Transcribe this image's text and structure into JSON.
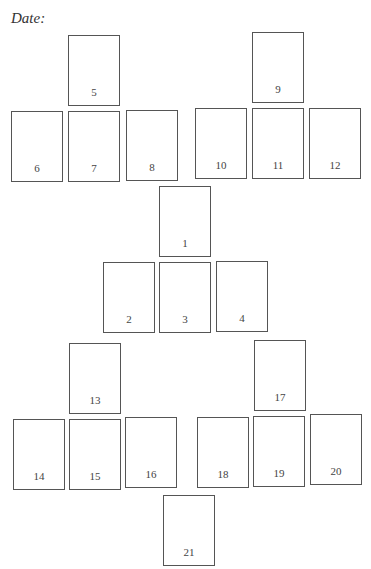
{
  "header": {
    "date_label": "Date:"
  },
  "spread": {
    "border_color": "#555555",
    "slots": [
      {
        "number": "1",
        "x": 159,
        "y": 186
      },
      {
        "number": "2",
        "x": 103,
        "y": 262
      },
      {
        "number": "3",
        "x": 159,
        "y": 262
      },
      {
        "number": "4",
        "x": 216,
        "y": 261
      },
      {
        "number": "5",
        "x": 68,
        "y": 35
      },
      {
        "number": "6",
        "x": 11,
        "y": 111
      },
      {
        "number": "7",
        "x": 68,
        "y": 111
      },
      {
        "number": "8",
        "x": 126,
        "y": 110
      },
      {
        "number": "9",
        "x": 252,
        "y": 32
      },
      {
        "number": "10",
        "x": 195,
        "y": 108
      },
      {
        "number": "11",
        "x": 252,
        "y": 108
      },
      {
        "number": "12",
        "x": 309,
        "y": 108
      },
      {
        "number": "13",
        "x": 69,
        "y": 343
      },
      {
        "number": "14",
        "x": 13,
        "y": 419
      },
      {
        "number": "15",
        "x": 69,
        "y": 419
      },
      {
        "number": "16",
        "x": 125,
        "y": 417
      },
      {
        "number": "17",
        "x": 254,
        "y": 340
      },
      {
        "number": "18",
        "x": 197,
        "y": 417
      },
      {
        "number": "19",
        "x": 253,
        "y": 416
      },
      {
        "number": "20",
        "x": 310,
        "y": 414
      },
      {
        "number": "21",
        "x": 163,
        "y": 495
      }
    ]
  }
}
